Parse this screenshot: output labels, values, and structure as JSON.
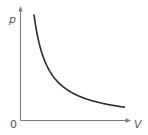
{
  "diagram": {
    "y_axis_label": "p",
    "x_axis_label": "V",
    "origin_label": "0",
    "curve": "hyperbola p ∝ 1/V",
    "colors": {
      "axis": "#7a7a7a",
      "curve": "#2a2a2a",
      "label": "#555555"
    }
  },
  "chart_data": {
    "type": "line",
    "title": "",
    "xlabel": "V",
    "ylabel": "p",
    "origin": "0",
    "grid": false,
    "legend": "none",
    "series": [
      {
        "name": "p = k/V",
        "x": [
          0.13,
          0.2,
          0.3,
          0.4,
          0.5,
          0.6,
          0.7,
          0.8,
          0.9,
          1.0
        ],
        "y": [
          1.0,
          0.65,
          0.43,
          0.33,
          0.26,
          0.22,
          0.19,
          0.16,
          0.14,
          0.13
        ]
      }
    ]
  }
}
